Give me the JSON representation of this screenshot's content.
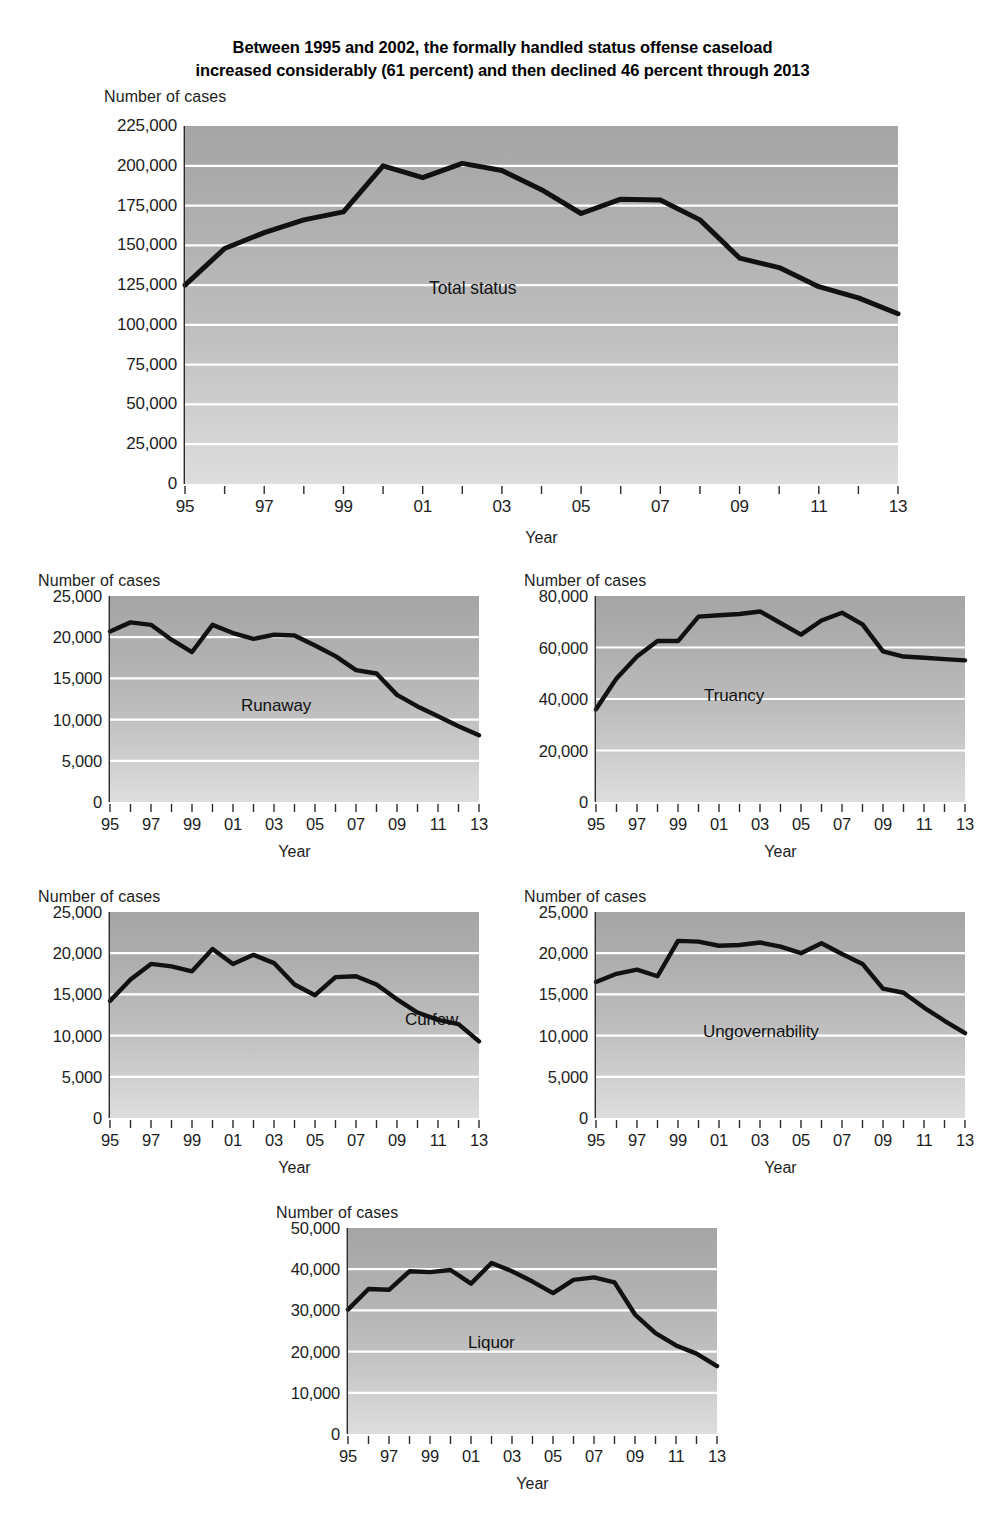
{
  "title": {
    "line1": "Between 1995 and 2002, the formally handled status offense caseload",
    "line2": "increased considerably (61 percent) and then declined 46 percent through 2013"
  },
  "labels": {
    "y_axis_title": "Number of cases",
    "x_axis_title": "Year"
  },
  "chart_data": [
    {
      "id": "total-status",
      "type": "line",
      "title": "Total status",
      "series_label": "Total status",
      "xlabel": "Year",
      "ylabel": "Number of cases",
      "ylim": [
        0,
        225000
      ],
      "ytick_values": [
        0,
        25000,
        50000,
        75000,
        100000,
        125000,
        150000,
        175000,
        200000,
        225000
      ],
      "ytick_labels": [
        "0",
        "25,000",
        "50,000",
        "75,000",
        "100,000",
        "125,000",
        "150,000",
        "175,000",
        "200,000",
        "225,000"
      ],
      "x": [
        1995,
        1996,
        1997,
        1998,
        1999,
        2000,
        2001,
        2002,
        2003,
        2004,
        2005,
        2006,
        2007,
        2008,
        2009,
        2010,
        2011,
        2012,
        2013
      ],
      "xtick_labels": [
        "95",
        "",
        "97",
        "",
        "99",
        "",
        "01",
        "",
        "03",
        "",
        "05",
        "",
        "07",
        "",
        "09",
        "",
        "11",
        "",
        "13"
      ],
      "values": [
        125000,
        148000,
        158000,
        166000,
        171000,
        200000,
        192500,
        201500,
        197000,
        185000,
        170000,
        179000,
        178500,
        166000,
        142000,
        136000,
        124000,
        117000,
        107000
      ],
      "grid": true
    },
    {
      "id": "runaway",
      "type": "line",
      "title": "Runaway",
      "series_label": "Runaway",
      "xlabel": "Year",
      "ylabel": "Number of cases",
      "ylim": [
        0,
        25000
      ],
      "ytick_values": [
        0,
        5000,
        10000,
        15000,
        20000,
        25000
      ],
      "ytick_labels": [
        "0",
        "5,000",
        "10,000",
        "15,000",
        "20,000",
        "25,000"
      ],
      "x": [
        1995,
        1996,
        1997,
        1998,
        1999,
        2000,
        2001,
        2002,
        2003,
        2004,
        2005,
        2006,
        2007,
        2008,
        2009,
        2010,
        2011,
        2012,
        2013
      ],
      "xtick_labels": [
        "95",
        "",
        "97",
        "",
        "99",
        "",
        "01",
        "",
        "03",
        "",
        "05",
        "",
        "07",
        "",
        "09",
        "",
        "11",
        "",
        "13"
      ],
      "values": [
        20700,
        21800,
        21500,
        19700,
        18200,
        21500,
        20500,
        19800,
        20300,
        20200,
        19000,
        17700,
        16000,
        15600,
        13000,
        11600,
        10400,
        9200,
        8100
      ],
      "grid": true
    },
    {
      "id": "truancy",
      "type": "line",
      "title": "Truancy",
      "series_label": "Truancy",
      "xlabel": "Year",
      "ylabel": "Number of cases",
      "ylim": [
        0,
        80000
      ],
      "ytick_values": [
        0,
        20000,
        40000,
        60000,
        80000
      ],
      "ytick_labels": [
        "0",
        "20,000",
        "40,000",
        "60,000",
        "80,000"
      ],
      "x": [
        1995,
        1996,
        1997,
        1998,
        1999,
        2000,
        2001,
        2002,
        2003,
        2004,
        2005,
        2006,
        2007,
        2008,
        2009,
        2010,
        2011,
        2012,
        2013
      ],
      "xtick_labels": [
        "95",
        "",
        "97",
        "",
        "99",
        "",
        "01",
        "",
        "03",
        "",
        "05",
        "",
        "07",
        "",
        "09",
        "",
        "11",
        "",
        "13"
      ],
      "values": [
        36000,
        48000,
        56500,
        62500,
        62500,
        72000,
        72500,
        73000,
        74000,
        69500,
        65000,
        70500,
        73500,
        69000,
        58500,
        56500,
        56000,
        55500,
        55000
      ],
      "grid": true
    },
    {
      "id": "curfew",
      "type": "line",
      "title": "Curfew",
      "series_label": "Curfew",
      "xlabel": "Year",
      "ylabel": "Number of cases",
      "ylim": [
        0,
        25000
      ],
      "ytick_values": [
        0,
        5000,
        10000,
        15000,
        20000,
        25000
      ],
      "ytick_labels": [
        "0",
        "5,000",
        "10,000",
        "15,000",
        "20,000",
        "25,000"
      ],
      "x": [
        1995,
        1996,
        1997,
        1998,
        1999,
        2000,
        2001,
        2002,
        2003,
        2004,
        2005,
        2006,
        2007,
        2008,
        2009,
        2010,
        2011,
        2012,
        2013
      ],
      "xtick_labels": [
        "95",
        "",
        "97",
        "",
        "99",
        "",
        "01",
        "",
        "03",
        "",
        "05",
        "",
        "07",
        "",
        "09",
        "",
        "11",
        "",
        "13"
      ],
      "values": [
        14200,
        16800,
        18700,
        18400,
        17800,
        20500,
        18700,
        19800,
        18800,
        16200,
        14900,
        17100,
        17200,
        16200,
        14400,
        12800,
        11900,
        11400,
        9300
      ],
      "grid": true
    },
    {
      "id": "ungovernability",
      "type": "line",
      "title": "Ungovernability",
      "series_label": "Ungovernability",
      "xlabel": "Year",
      "ylabel": "Number of cases",
      "ylim": [
        0,
        25000
      ],
      "ytick_values": [
        0,
        5000,
        10000,
        15000,
        20000,
        25000
      ],
      "ytick_labels": [
        "0",
        "5,000",
        "10,000",
        "15,000",
        "20,000",
        "25,000"
      ],
      "x": [
        1995,
        1996,
        1997,
        1998,
        1999,
        2000,
        2001,
        2002,
        2003,
        2004,
        2005,
        2006,
        2007,
        2008,
        2009,
        2010,
        2011,
        2012,
        2013
      ],
      "xtick_labels": [
        "95",
        "",
        "97",
        "",
        "99",
        "",
        "01",
        "",
        "03",
        "",
        "05",
        "",
        "07",
        "",
        "09",
        "",
        "11",
        "",
        "13"
      ],
      "values": [
        16500,
        17500,
        18000,
        17200,
        21500,
        21400,
        20900,
        21000,
        21300,
        20800,
        20000,
        21200,
        19900,
        18700,
        15700,
        15200,
        13400,
        11800,
        10300
      ],
      "grid": true
    },
    {
      "id": "liquor",
      "type": "line",
      "title": "Liquor",
      "series_label": "Liquor",
      "xlabel": "Year",
      "ylabel": "Number of cases",
      "ylim": [
        0,
        50000
      ],
      "ytick_values": [
        0,
        10000,
        20000,
        30000,
        40000,
        50000
      ],
      "ytick_labels": [
        "0",
        "10,000",
        "20,000",
        "30,000",
        "40,000",
        "50,000"
      ],
      "x": [
        1995,
        1996,
        1997,
        1998,
        1999,
        2000,
        2001,
        2002,
        2003,
        2004,
        2005,
        2006,
        2007,
        2008,
        2009,
        2010,
        2011,
        2012,
        2013
      ],
      "xtick_labels": [
        "95",
        "",
        "97",
        "",
        "99",
        "",
        "01",
        "",
        "03",
        "",
        "05",
        "",
        "07",
        "",
        "09",
        "",
        "11",
        "",
        "13"
      ],
      "values": [
        30200,
        35200,
        35000,
        39500,
        39300,
        39800,
        36500,
        41500,
        39500,
        37000,
        34200,
        37400,
        38000,
        36800,
        29000,
        24500,
        21500,
        19500,
        16500
      ],
      "grid": true
    }
  ],
  "colors": {
    "line": "#111111",
    "grid": "#ffffff",
    "plot_bg_top": "#a5a5a5",
    "plot_bg_bottom": "#dedede",
    "text": "#1d1d1d"
  }
}
